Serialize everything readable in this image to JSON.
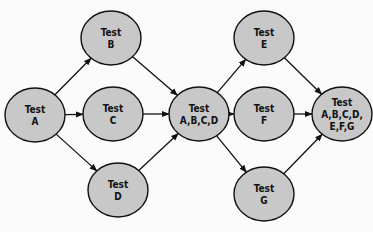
{
  "diagram": {
    "type": "flow",
    "colors": {
      "node_fill": "#c8c8c8",
      "node_stroke": "#111111",
      "edge": "#111111",
      "background": "#fbfbfb"
    },
    "nodes": [
      {
        "id": "A",
        "lines": [
          "Test",
          "A"
        ],
        "cx": 35,
        "cy": 115
      },
      {
        "id": "B",
        "lines": [
          "Test",
          "B"
        ],
        "cx": 111,
        "cy": 38
      },
      {
        "id": "C",
        "lines": [
          "Test",
          "C"
        ],
        "cx": 113,
        "cy": 114
      },
      {
        "id": "D",
        "lines": [
          "Test",
          "D"
        ],
        "cx": 118,
        "cy": 190
      },
      {
        "id": "ABCD",
        "lines": [
          "Test",
          "A,B,C,D"
        ],
        "cx": 199,
        "cy": 114
      },
      {
        "id": "E",
        "lines": [
          "Test",
          "E"
        ],
        "cx": 264,
        "cy": 38
      },
      {
        "id": "F",
        "lines": [
          "Test",
          "F"
        ],
        "cx": 264,
        "cy": 114
      },
      {
        "id": "G",
        "lines": [
          "Test",
          "G"
        ],
        "cx": 264,
        "cy": 194
      },
      {
        "id": "ALL",
        "lines": [
          "Test",
          "A,B,C,D,",
          "E,F,G"
        ],
        "cx": 342,
        "cy": 114
      }
    ],
    "edges": [
      [
        "A",
        "B"
      ],
      [
        "A",
        "C"
      ],
      [
        "A",
        "D"
      ],
      [
        "B",
        "ABCD"
      ],
      [
        "C",
        "ABCD"
      ],
      [
        "D",
        "ABCD"
      ],
      [
        "ABCD",
        "E"
      ],
      [
        "ABCD",
        "F"
      ],
      [
        "ABCD",
        "G"
      ],
      [
        "E",
        "ALL"
      ],
      [
        "F",
        "ALL"
      ],
      [
        "G",
        "ALL"
      ]
    ]
  }
}
